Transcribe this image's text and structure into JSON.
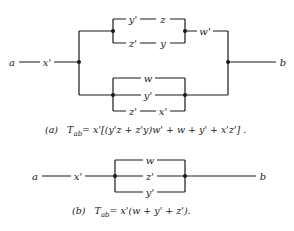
{
  "diagram_a": {
    "terminal_left": "a",
    "terminal_right": "b",
    "series_contact": "x'",
    "upper_group": {
      "path_top": [
        "y'",
        "z"
      ],
      "path_bottom": [
        "z'",
        "y"
      ],
      "series_contact": "w'"
    },
    "lower_group": {
      "path_top": [
        "w"
      ],
      "path_middle": [
        "y'"
      ],
      "path_bottom": [
        "z'",
        "x'"
      ]
    },
    "caption_label": "(a)",
    "caption_formula": "T",
    "caption_subscript": "ab",
    "caption_expression": "= x'[(y'z + z'y)w' + w + y' + x'z'] ."
  },
  "diagram_b": {
    "terminal_left": "a",
    "terminal_right": "b",
    "series_contact": "x'",
    "parallel_contacts": [
      "w",
      "z'",
      "y'"
    ],
    "caption_label": "(b)",
    "caption_formula": "T",
    "caption_subscript": "ab",
    "caption_expression": "= x'(w + y' + z')."
  }
}
